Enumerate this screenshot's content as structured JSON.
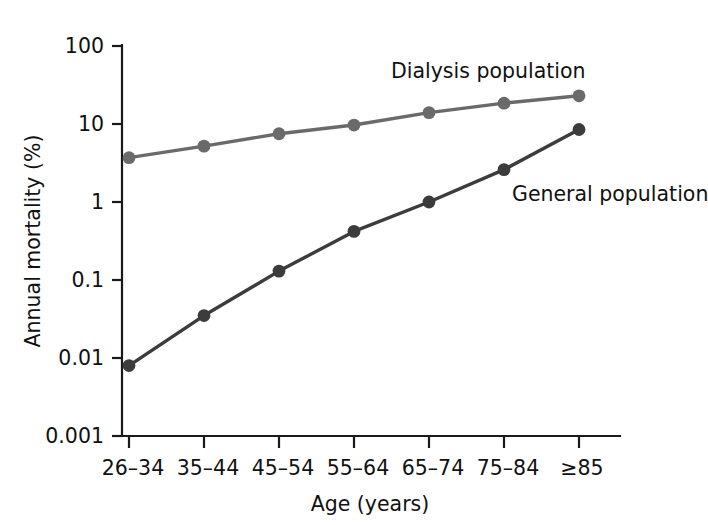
{
  "chart_data": {
    "type": "line",
    "title": "",
    "xlabel": "Age (years)",
    "ylabel": "Annual mortality (%)",
    "categories": [
      "26–34",
      "35–44",
      "45–54",
      "55–64",
      "65–74",
      "75–84",
      "≥85"
    ],
    "yscale": "log",
    "ylim": [
      0.001,
      100
    ],
    "yticks": [
      "100",
      "10",
      "1",
      "0.1",
      "0.01",
      "0.001"
    ],
    "ytick_values": [
      100,
      10,
      1,
      0.1,
      0.01,
      0.001
    ],
    "grid": false,
    "legend_position": "inline-annotation",
    "series": [
      {
        "name": "Dialysis population",
        "color": "#6a6a6a",
        "marker": "circle",
        "values": [
          3.7,
          5.2,
          7.5,
          9.7,
          14.0,
          18.5,
          23.0
        ]
      },
      {
        "name": "General population",
        "color": "#3c3c3c",
        "marker": "circle",
        "values": [
          0.008,
          0.035,
          0.13,
          0.42,
          1.0,
          2.6,
          8.5
        ]
      }
    ],
    "annotations": [
      {
        "text": "Dialysis population",
        "series": "Dialysis population"
      },
      {
        "text": "General population",
        "series": "General population"
      }
    ]
  },
  "axis": {
    "y_title": "Annual mortality (%)",
    "x_title": "Age (years)"
  },
  "colors": {
    "axis": "#1a1a1a",
    "dialysis": "#6a6a6a",
    "general": "#3c3c3c",
    "background": "#ffffff"
  }
}
